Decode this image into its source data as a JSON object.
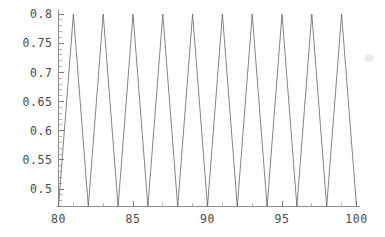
{
  "chart_data": {
    "type": "line",
    "title": "",
    "subtitle": "",
    "xlabel": "",
    "ylabel": "",
    "xlim": [
      80,
      100
    ],
    "ylim": [
      0.47,
      0.805
    ],
    "grid": false,
    "legend": null,
    "line_color": "#6e6e6e",
    "axis_color": "#8d8d8d",
    "background": "#ffffff",
    "x_ticks_major": [
      80,
      85,
      90,
      95,
      100
    ],
    "x_tick_labels": [
      "80",
      "85",
      "90",
      "95",
      "100"
    ],
    "x_ticks_minor_step": 1,
    "y_ticks_major": [
      0.5,
      0.55,
      0.6,
      0.65,
      0.7,
      0.75,
      0.8
    ],
    "y_tick_labels": [
      "0.5",
      "0.55",
      "0.6",
      "0.65",
      "0.7",
      "0.75",
      "0.8"
    ],
    "y_ticks_minor_step": 0.01,
    "series": [
      {
        "name": "triangle-wave",
        "x": [
          80,
          81,
          82,
          83,
          84,
          85,
          86,
          87,
          88,
          89,
          90,
          91,
          92,
          93,
          94,
          95,
          96,
          97,
          98,
          99,
          100
        ],
        "y": [
          0.47,
          0.8,
          0.47,
          0.8,
          0.47,
          0.8,
          0.47,
          0.8,
          0.47,
          0.8,
          0.47,
          0.8,
          0.47,
          0.8,
          0.47,
          0.8,
          0.47,
          0.8,
          0.47,
          0.8,
          0.47
        ]
      }
    ],
    "peaks": {
      "x": [
        81,
        83,
        85,
        87,
        89,
        91,
        93,
        95,
        97,
        99
      ],
      "value": 0.8,
      "count": 10
    },
    "troughs": {
      "x": [
        80,
        82,
        84,
        86,
        88,
        90,
        92,
        94,
        96,
        98,
        100
      ],
      "value": 0.47,
      "count": 11
    }
  },
  "figure": {
    "name": "oscillation-plot",
    "width": 385,
    "height": 237
  }
}
